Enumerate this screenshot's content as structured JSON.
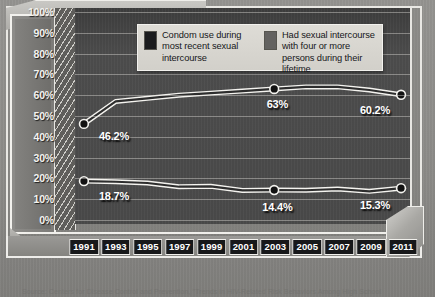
{
  "chart_data": {
    "type": "line",
    "title": "",
    "subtitle": "",
    "xlabel": "",
    "ylabel": "",
    "ylim": [
      0,
      100
    ],
    "ytick_labels": [
      "100%",
      "90%",
      "80%",
      "70%",
      "60%",
      "50%",
      "40%",
      "30%",
      "20%",
      "10%",
      "0%"
    ],
    "ytick_values": [
      100,
      90,
      80,
      70,
      60,
      50,
      40,
      30,
      20,
      10,
      0
    ],
    "grid": true,
    "legend_position": "top-center",
    "categories": [
      "1991",
      "1993",
      "1995",
      "1997",
      "1999",
      "2001",
      "2003",
      "2005",
      "2007",
      "2009",
      "2011"
    ],
    "series": [
      {
        "name": "Condom use during most recent sexual intercourse",
        "color": "#2d2d2d",
        "values": [
          46.2,
          57.0,
          58.5,
          60.0,
          61.0,
          62.0,
          63.0,
          64.0,
          64.0,
          62.5,
          60.2
        ],
        "point_labels": [
          {
            "index": 0,
            "text": "46.2%"
          },
          {
            "index": 6,
            "text": "63%"
          },
          {
            "index": 10,
            "text": "60.2%"
          }
        ]
      },
      {
        "name": "Had sexual intercourse with four or more persons during their lifetime",
        "color": "#2d2d2d",
        "values": [
          18.7,
          18.4,
          17.8,
          16.0,
          16.2,
          14.2,
          14.4,
          14.3,
          14.9,
          13.8,
          15.3
        ],
        "point_labels": [
          {
            "index": 0,
            "text": "18.7%"
          },
          {
            "index": 6,
            "text": "14.4%"
          },
          {
            "index": 10,
            "text": "15.3%"
          }
        ]
      }
    ]
  },
  "legend": {
    "items": [
      {
        "swatch_color": "#1b1c1e",
        "label": "Condom use during most recent sexual intercourse"
      },
      {
        "swatch_color": "#636260",
        "label": "Had sexual intercourse with four or more persons during their lifetime"
      }
    ]
  },
  "source": {
    "text": "Source: Centers for Disease Control and Prevention, \"Trends in HIV-Related Risk Behaviors Among High School"
  }
}
